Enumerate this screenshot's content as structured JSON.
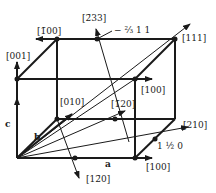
{
  "diagram": {
    "type": "crystal lattice unit cell with direction vectors",
    "axes": {
      "a": "a",
      "b": "b",
      "c": "c"
    },
    "labels": {
      "dir_100_top": "[100]",
      "dir_100_bottom": "[100]",
      "dir_m100": "[1̄00]",
      "dir_001": "[001]",
      "dir_010": "[010]",
      "dir_111": "[111]",
      "dir_120": "[1̄20]",
      "dir_1m20": "[12̄0]",
      "dir_210": "[210]",
      "dir_m233": "[2̄33]",
      "dir_m2311": "− ⅔ 1 1",
      "dir_1half0": "1 ½ 0"
    },
    "colors": {
      "line": "#1a1a1a",
      "background": "#ffffff"
    }
  }
}
